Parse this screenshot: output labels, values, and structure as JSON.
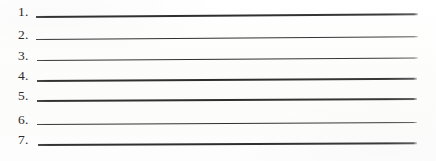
{
  "document": {
    "type": "worksheet-blank-numbered-lines",
    "title": "Numbered blank answer lines",
    "background_color": "#fdfdfc",
    "rule_color": "#2e2e2e",
    "text_color": "#2b2b2b",
    "item_count": 7
  },
  "items": [
    {
      "number": "1.",
      "line_text": "",
      "top": 2,
      "line_left": 36,
      "line_width": 382,
      "line_tilt_deg": -0.42,
      "line_thickness": 1.5
    },
    {
      "number": "2.",
      "line_text": "",
      "top": 25,
      "line_left": 36,
      "line_width": 382,
      "line_tilt_deg": -0.4,
      "line_thickness": 1.4
    },
    {
      "number": "3.",
      "line_text": "",
      "top": 46,
      "line_left": 37,
      "line_width": 381,
      "line_tilt_deg": -0.38,
      "line_thickness": 1.4
    },
    {
      "number": "4.",
      "line_text": "",
      "top": 66,
      "line_left": 37,
      "line_width": 380,
      "line_tilt_deg": -0.34,
      "line_thickness": 1.5
    },
    {
      "number": "5.",
      "line_text": "",
      "top": 86,
      "line_left": 37,
      "line_width": 380,
      "line_tilt_deg": -0.32,
      "line_thickness": 1.5
    },
    {
      "number": "6.",
      "line_text": "",
      "top": 110,
      "line_left": 37,
      "line_width": 380,
      "line_tilt_deg": -0.3,
      "line_thickness": 1.4
    },
    {
      "number": "7.",
      "line_text": "",
      "top": 130,
      "line_left": 38,
      "line_width": 379,
      "line_tilt_deg": -0.28,
      "line_thickness": 1.5
    }
  ]
}
